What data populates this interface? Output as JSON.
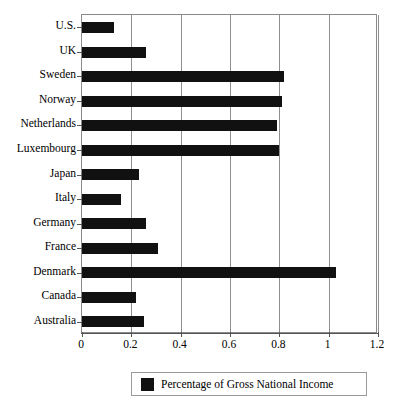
{
  "chart_data": {
    "type": "bar",
    "orientation": "horizontal",
    "title": "",
    "subtitle": "",
    "xlabel": "",
    "ylabel": "",
    "categories": [
      "U.S.",
      "UK",
      "Sweden",
      "Norway",
      "Netherlands",
      "Luxembourg",
      "Japan",
      "Italy",
      "Germany",
      "France",
      "Denmark",
      "Canada",
      "Australia"
    ],
    "values": [
      0.13,
      0.26,
      0.82,
      0.81,
      0.79,
      0.8,
      0.23,
      0.16,
      0.26,
      0.31,
      1.03,
      0.22,
      0.25
    ],
    "series": [
      {
        "name": "Percentage of Gross National Income",
        "values": [
          0.13,
          0.26,
          0.82,
          0.81,
          0.79,
          0.8,
          0.23,
          0.16,
          0.26,
          0.31,
          1.03,
          0.22,
          0.25
        ],
        "color": "#111111"
      }
    ],
    "xlim": [
      0,
      1.2
    ],
    "xticks": [
      0,
      0.2,
      0.4,
      0.6,
      0.8,
      1,
      1.2
    ],
    "xticklabels": [
      "0",
      "0.2",
      "0.4",
      "0.6",
      "0.8",
      "1",
      "1.2"
    ],
    "grid": "vertical",
    "legend": {
      "position": "bottom",
      "entries": [
        {
          "label": "Percentage of Gross National Income",
          "color": "#111111",
          "swatch": "filled-square-swatch"
        }
      ]
    },
    "bar_color": "#111111",
    "frame_color": "#8a8a8a",
    "background": "#ffffff"
  }
}
